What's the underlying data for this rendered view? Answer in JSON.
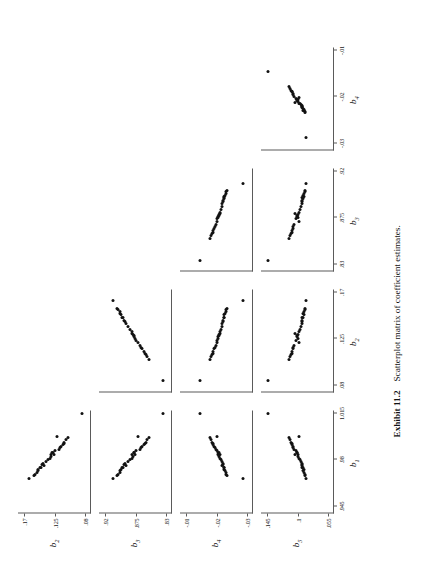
{
  "figure": {
    "caption_label": "Exhibit 11.2",
    "caption_text": "Scatterplot matrix of coefficient estimates."
  },
  "chart_data": {
    "type": "scatter",
    "title": "Scatterplot matrix of coefficient estimates.",
    "layout": "lower-triangular scatterplot matrix, 4 rows x 4 columns",
    "grid": false,
    "legend": "none",
    "orientation": "page rotated 90 degrees counter-clockwise in the scan",
    "columns": [
      {
        "key": "b1",
        "label": "b",
        "sub": "1",
        "ticks": [
          ".945",
          ".98",
          "1.015"
        ],
        "range": [
          0.945,
          1.015
        ]
      },
      {
        "key": "b2",
        "label": "b",
        "sub": "2",
        "ticks": [
          ".08",
          ".125",
          ".17"
        ],
        "range": [
          0.08,
          0.17
        ]
      },
      {
        "key": "b3",
        "label": "b",
        "sub": "3",
        "ticks": [
          ".83",
          ".875",
          ".92"
        ],
        "range": [
          0.83,
          0.92
        ]
      },
      {
        "key": "b4",
        "label": "b",
        "sub": "4",
        "ticks": [
          "-.03",
          "-.02",
          "-.01"
        ],
        "range": [
          -0.03,
          -0.01
        ]
      }
    ],
    "rows": [
      {
        "key": "b2",
        "label": "b",
        "sub": "2",
        "ticks": [
          ".08",
          ".125",
          ".17"
        ],
        "range": [
          0.08,
          0.17
        ]
      },
      {
        "key": "b3",
        "label": "b",
        "sub": "3",
        "ticks": [
          ".83",
          ".875",
          ".92"
        ],
        "range": [
          0.83,
          0.92
        ]
      },
      {
        "key": "b4",
        "label": "b",
        "sub": "4",
        "ticks": [
          "-.03",
          "-.02",
          "-.01"
        ],
        "range": [
          -0.03,
          -0.01
        ]
      },
      {
        "key": "b5",
        "label": "b",
        "sub": "5",
        "ticks": [
          ".055",
          ".1",
          ".145"
        ],
        "range": [
          0.055,
          0.145
        ]
      }
    ],
    "n_points": 30,
    "series": [
      {
        "name": "b1",
        "values": [
          0.998,
          0.9762,
          0.9845,
          0.9731,
          0.9902,
          1.0148,
          0.9688,
          0.9805,
          0.9934,
          0.9772,
          0.9858,
          0.9703,
          0.9881,
          0.9969,
          0.9745,
          0.9826,
          0.9915,
          0.9659,
          0.979,
          0.9871,
          0.9952,
          0.9718,
          0.9838,
          0.9893,
          0.9764,
          0.9925,
          0.9682,
          0.9812,
          0.986,
          0.9746
        ]
      },
      {
        "name": "b2",
        "values": [
          0.1215,
          0.1402,
          0.1308,
          0.1489,
          0.116,
          0.0845,
          0.1536,
          0.1342,
          0.1103,
          0.1418,
          0.1275,
          0.1512,
          0.1188,
          0.1052,
          0.1455,
          0.1296,
          0.1128,
          0.162,
          0.1372,
          0.124,
          0.1085,
          0.1498,
          0.1258,
          0.1165,
          0.143,
          0.1112,
          0.1548,
          0.1322,
          0.1282,
          0.1462
        ]
      },
      {
        "name": "b3",
        "values": [
          0.872,
          0.8888,
          0.8795,
          0.8962,
          0.8648,
          0.8342,
          0.9008,
          0.883,
          0.8602,
          0.8905,
          0.8765,
          0.8985,
          0.8688,
          0.8548,
          0.894,
          0.8782,
          0.8628,
          0.9082,
          0.8858,
          0.8742,
          0.8585,
          0.8972,
          0.8755,
          0.8668,
          0.8918,
          0.8612,
          0.902,
          0.8808,
          0.8772,
          0.8948
        ]
      },
      {
        "name": "b4",
        "values": [
          -0.0201,
          -0.0218,
          -0.0212,
          -0.0226,
          -0.0192,
          -0.0145,
          -0.0232,
          -0.0215,
          -0.0186,
          -0.022,
          -0.0205,
          -0.023,
          -0.0198,
          -0.0178,
          -0.0224,
          -0.0209,
          -0.0189,
          -0.0288,
          -0.0217,
          -0.0203,
          -0.0182,
          -0.0228,
          -0.0206,
          -0.0195,
          -0.0221,
          -0.0188,
          -0.0234,
          -0.0213,
          -0.0208,
          -0.0223
        ]
      },
      {
        "name": "b5",
        "values": [
          0.0985,
          0.0932,
          0.1042,
          0.0908,
          0.1068,
          0.1428,
          0.0895,
          0.0962,
          0.1095,
          0.094,
          0.1008,
          0.0902,
          0.1052,
          0.112,
          0.0925,
          0.0995,
          0.1078,
          0.0872,
          0.0948,
          0.1025,
          0.1105,
          0.0912,
          0.1,
          0.106,
          0.0938,
          0.1088,
          0.0885,
          0.0972,
          0.1012,
          0.093
        ]
      }
    ],
    "pairs": [
      {
        "row": "b2",
        "col": "b1",
        "relation": "weak / scattered"
      },
      {
        "row": "b3",
        "col": "b1",
        "relation": "weak / scattered"
      },
      {
        "row": "b3",
        "col": "b2",
        "relation": "strong positive, near-linear"
      },
      {
        "row": "b4",
        "col": "b1",
        "relation": "strong negative, near-linear"
      },
      {
        "row": "b4",
        "col": "b2",
        "relation": "weak / scattered"
      },
      {
        "row": "b4",
        "col": "b3",
        "relation": "weak / scattered"
      },
      {
        "row": "b5",
        "col": "b1",
        "relation": "weak / scattered"
      },
      {
        "row": "b5",
        "col": "b2",
        "relation": "moderate negative"
      },
      {
        "row": "b5",
        "col": "b3",
        "relation": "moderate positive"
      },
      {
        "row": "b5",
        "col": "b4",
        "relation": "weak / scattered"
      }
    ]
  }
}
